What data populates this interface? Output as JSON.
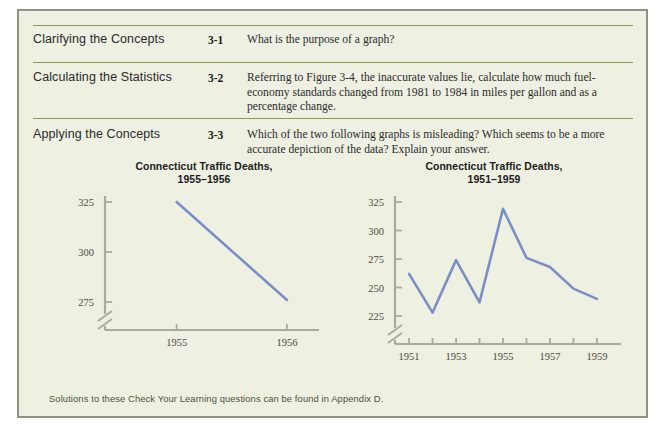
{
  "colors": {
    "page_background": "#eef0e2",
    "page_border": "#8f9384",
    "rule_green": "#8a9a58",
    "axis_gray": "#a9aa9c",
    "line_blue": "#7b8fc7",
    "heading_text": "#2a2a2a",
    "body_text": "#2b2b2b",
    "footer_text": "#4b5340"
  },
  "rows": [
    {
      "category": "Clarifying the Concepts",
      "number": "3-1",
      "question": "What is the purpose of a graph?"
    },
    {
      "category": "Calculating the Statistics",
      "number": "3-2",
      "question": "Referring to Figure 3-4, the inaccurate values lie, calculate how much fuel-economy standards changed from 1981 to 1984 in miles per gallon and as a percentage change."
    },
    {
      "category": "Applying the Concepts",
      "number": "3-3",
      "question": "Which of the two following graphs is misleading? Which seems to be a more accurate depiction of the data? Explain your answer."
    }
  ],
  "footer": "Solutions to these Check Your Learning questions can be found in Appendix D.",
  "chart_data": [
    {
      "type": "line",
      "title": "Connecticut Traffic Deaths,",
      "subtitle": "1955–1956",
      "x": [
        1955,
        1956
      ],
      "values": [
        325,
        276
      ],
      "xtick_labels": [
        "1955",
        "1956"
      ],
      "ytick_labels": [
        "275",
        "300",
        "325"
      ],
      "yticks": [
        275,
        300,
        325
      ],
      "ylim": [
        275,
        325
      ],
      "xlim": [
        1954.35,
        1956.2
      ],
      "xlabel": "",
      "ylabel": "",
      "axis_break": true,
      "grid": false,
      "legend": "none"
    },
    {
      "type": "line",
      "title": "Connecticut Traffic Deaths,",
      "subtitle": "1951–1959",
      "x": [
        1951,
        1952,
        1953,
        1954,
        1955,
        1956,
        1957,
        1958,
        1959
      ],
      "values": [
        262,
        228,
        274,
        237,
        319,
        276,
        268,
        249,
        240
      ],
      "xtick_labels": [
        "1951",
        "1953",
        "1955",
        "1957",
        "1959"
      ],
      "ytick_labels": [
        "225",
        "250",
        "275",
        "300",
        "325"
      ],
      "yticks": [
        225,
        250,
        275,
        300,
        325
      ],
      "ylim": [
        225,
        325
      ],
      "xlim": [
        1950.4,
        1959.6
      ],
      "xlabel": "",
      "ylabel": "",
      "axis_break": true,
      "grid": false,
      "legend": "none"
    }
  ]
}
